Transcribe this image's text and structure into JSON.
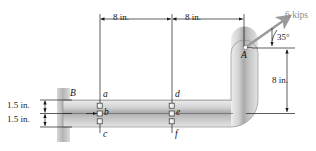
{
  "figure": {
    "type": "engineering-mechanics-diagram"
  },
  "dimensions": {
    "top_left_span": "8 in.",
    "top_right_span": "8 in.",
    "right_vertical": "8 in.",
    "left_upper": "1.5 in.",
    "left_lower": "1.5 in."
  },
  "load": {
    "magnitude": "6 kips",
    "angle": "35°"
  },
  "points": {
    "support": "B",
    "load_point": "A",
    "section1_top": "a",
    "section1_mid": "b",
    "section1_bot": "c",
    "section2_top": "d",
    "section2_mid": "e",
    "section2_bot": "f"
  },
  "colors": {
    "beam_light": "#e9e9e9",
    "beam_mid": "#b9b9b9",
    "beam_dark": "#9a9a9a",
    "wall": "#c9c9c9",
    "line": "#1a1a1a",
    "force_text": "#8a8a8a",
    "arrow": "#9a9a9a"
  }
}
